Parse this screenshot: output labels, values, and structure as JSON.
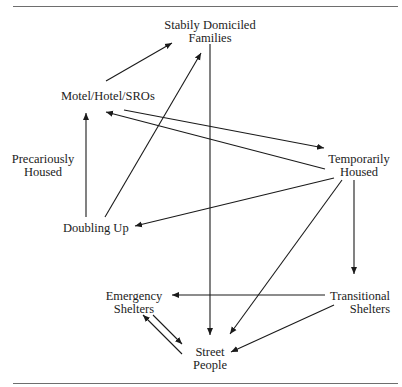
{
  "diagram": {
    "type": "flow",
    "stroke_color": "#1a1a1a",
    "rule_color": "#6e6e6e",
    "nodes": {
      "stably_domiciled": {
        "line1": "Stabily Domiciled",
        "line2": "Families"
      },
      "motel": {
        "line1": "Motel/Hotel/SROs"
      },
      "precariously_housed": {
        "line1": "Precariously",
        "line2": "Housed"
      },
      "temporarily_housed": {
        "line1": "Temporarily",
        "line2": "Housed"
      },
      "doubling_up": {
        "line1": "Doubling Up"
      },
      "emergency_shelters": {
        "line1": "Emergency",
        "line2": "Shelters"
      },
      "transitional_shelters": {
        "line1": "Transitional",
        "line2": "Shelters"
      },
      "street_people": {
        "line1": "Street",
        "line2": "People"
      }
    },
    "edges": [
      {
        "from": "Motel/Hotel/SROs",
        "to": "Stabily Domiciled Families"
      },
      {
        "from": "Doubling Up",
        "to": "Stabily Domiciled Families"
      },
      {
        "from": "Stabily Domiciled Families",
        "to": "Street People"
      },
      {
        "from": "Motel/Hotel/SROs",
        "to": "Temporarily Housed"
      },
      {
        "from": "Temporarily Housed",
        "to": "Motel/Hotel/SROs"
      },
      {
        "from": "Doubling Up",
        "to": "Motel/Hotel/SROs"
      },
      {
        "from": "Temporarily Housed",
        "to": "Doubling Up"
      },
      {
        "from": "Temporarily Housed",
        "to": "Street People"
      },
      {
        "from": "Temporarily Housed",
        "to": "Transitional Shelters"
      },
      {
        "from": "Transitional Shelters",
        "to": "Emergency Shelters"
      },
      {
        "from": "Transitional Shelters",
        "to": "Street People"
      },
      {
        "from": "Emergency Shelters",
        "to": "Street People"
      },
      {
        "from": "Street People",
        "to": "Emergency Shelters"
      }
    ]
  }
}
